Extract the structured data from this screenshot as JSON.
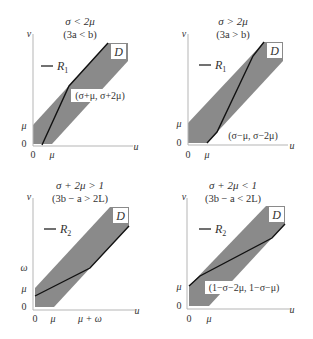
{
  "panels": [
    {
      "id": "top-left",
      "title": "σ < 2μ",
      "subtitle": "(3a < b)",
      "legend": "R",
      "legend_sub": "1",
      "region_label": "D",
      "axis_x": "u",
      "axis_y": "v",
      "x_ticks": [
        "0",
        "μ"
      ],
      "y_ticks": [
        "0",
        "μ"
      ],
      "point_label": "(σ+μ, σ+2μ)"
    },
    {
      "id": "top-right",
      "title": "σ > 2μ",
      "subtitle": "(3a > b)",
      "legend": "R",
      "legend_sub": "1",
      "region_label": "D",
      "axis_x": "u",
      "axis_y": "v",
      "x_ticks": [
        "0",
        "μ"
      ],
      "y_ticks": [
        "0",
        "μ"
      ],
      "point_label": "(σ−μ, σ−2μ)"
    },
    {
      "id": "bottom-left",
      "title": "σ + 2μ > 1",
      "subtitle": "(3b − a > 2L)",
      "legend": "R",
      "legend_sub": "2",
      "region_label": "D",
      "axis_x": "u",
      "axis_y": "v",
      "x_ticks": [
        "0",
        "μ",
        "μ + ω"
      ],
      "y_ticks": [
        "0",
        "μ",
        "ω"
      ],
      "point_label": ""
    },
    {
      "id": "bottom-right",
      "title": "σ + 2μ < 1",
      "subtitle": "(3b − a < 2L)",
      "legend": "R",
      "legend_sub": "2",
      "region_label": "D",
      "axis_x": "u",
      "axis_y": "v",
      "x_ticks": [
        "0",
        "μ"
      ],
      "y_ticks": [
        "0",
        "μ"
      ],
      "point_label": "(1−σ−2μ, 1−σ−μ)"
    }
  ],
  "colors": {
    "region_fill": "#8a8a8a",
    "axis": "#b0b0b0",
    "curve": "#111111",
    "text": "#333333"
  }
}
